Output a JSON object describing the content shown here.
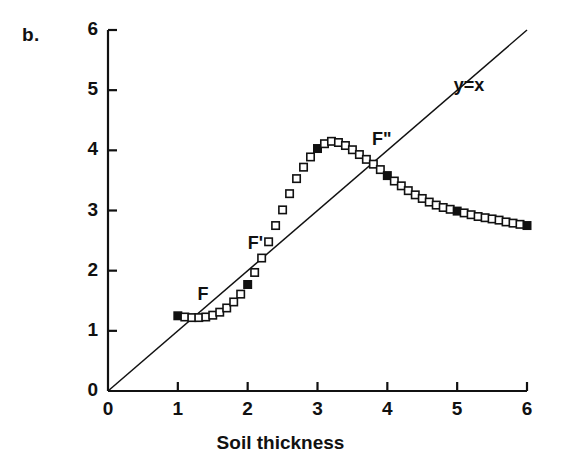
{
  "panel": {
    "label": "b."
  },
  "chart_data": {
    "type": "scatter",
    "title": "",
    "subtitle": "",
    "xlabel": "Soil thickness",
    "ylabel": "",
    "xlim": [
      0,
      6
    ],
    "ylim": [
      0,
      6
    ],
    "xticks": [
      0,
      1,
      2,
      3,
      4,
      5,
      6
    ],
    "yticks": [
      0,
      1,
      2,
      3,
      4,
      5,
      6
    ],
    "xtick_labels": [
      "0",
      "1",
      "2",
      "3",
      "4",
      "5",
      "6"
    ],
    "ytick_labels": [
      "0",
      "1",
      "2",
      "3",
      "4",
      "5",
      "6"
    ],
    "grid": false,
    "legend": "none",
    "series": [
      {
        "name": "response-curve",
        "marker": "square",
        "x": [
          1.0,
          1.1,
          1.2,
          1.3,
          1.4,
          1.5,
          1.6,
          1.7,
          1.8,
          1.9,
          2.0,
          2.1,
          2.2,
          2.3,
          2.4,
          2.5,
          2.6,
          2.7,
          2.8,
          2.9,
          3.0,
          3.1,
          3.2,
          3.3,
          3.4,
          3.5,
          3.6,
          3.7,
          3.8,
          3.9,
          4.0,
          4.1,
          4.2,
          4.3,
          4.4,
          4.5,
          4.6,
          4.7,
          4.8,
          4.9,
          5.0,
          5.1,
          5.2,
          5.3,
          5.4,
          5.5,
          5.6,
          5.7,
          5.8,
          5.9,
          6.0
        ],
        "y": [
          1.25,
          1.23,
          1.22,
          1.22,
          1.23,
          1.26,
          1.31,
          1.38,
          1.48,
          1.61,
          1.77,
          1.97,
          2.21,
          2.48,
          2.75,
          3.01,
          3.28,
          3.53,
          3.72,
          3.89,
          4.03,
          4.11,
          4.15,
          4.13,
          4.08,
          4.01,
          3.93,
          3.85,
          3.77,
          3.68,
          3.58,
          3.49,
          3.41,
          3.33,
          3.26,
          3.2,
          3.14,
          3.09,
          3.05,
          3.02,
          2.99,
          2.96,
          2.93,
          2.9,
          2.88,
          2.86,
          2.84,
          2.81,
          2.79,
          2.77,
          2.75
        ],
        "filled_at_x": [
          1.0,
          2.0,
          3.0,
          4.0,
          5.0,
          6.0
        ]
      }
    ],
    "reference_line": {
      "label": "y=x",
      "equation": "y = x",
      "from": [
        0,
        0
      ],
      "to": [
        6,
        6
      ]
    },
    "annotations": [
      {
        "text": "F",
        "x": 1.28,
        "y": 1.58
      },
      {
        "text": "F'",
        "x": 2.0,
        "y": 2.42
      },
      {
        "text": "F\"",
        "x": 3.78,
        "y": 4.15
      },
      {
        "text": "y=x",
        "x": 4.95,
        "y": 5.05
      }
    ]
  }
}
